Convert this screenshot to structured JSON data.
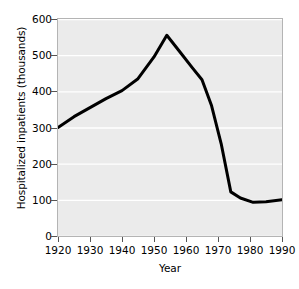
{
  "chart_data": {
    "type": "line",
    "title": "",
    "xlabel": "Year",
    "ylabel": "Hospitalized inpatients (thousands)",
    "xlim": [
      1920,
      1990
    ],
    "ylim": [
      0,
      600
    ],
    "xticks": [
      1920,
      1930,
      1940,
      1950,
      1960,
      1970,
      1980,
      1990
    ],
    "yticks": [
      0,
      100,
      200,
      300,
      400,
      500,
      600
    ],
    "grid": "horizontal",
    "legend": "none",
    "series": [
      {
        "name": "Hospitalized inpatients",
        "x": [
          1920,
          1925,
          1930,
          1935,
          1940,
          1945,
          1950,
          1954,
          1958,
          1962,
          1965,
          1968,
          1971,
          1974,
          1977,
          1981,
          1985,
          1990
        ],
        "values": [
          300,
          330,
          355,
          380,
          402,
          435,
          495,
          555,
          510,
          465,
          432,
          360,
          255,
          122,
          105,
          93,
          95,
          100
        ]
      }
    ],
    "line_color": "#000000",
    "line_width": 3,
    "plot_background": "#ebebeb",
    "gridline_color": "#ffffff"
  },
  "axis": {
    "y_tick_labels": [
      "600",
      "500",
      "400",
      "300",
      "200",
      "100",
      "0"
    ],
    "x_tick_labels": [
      "1920",
      "1930",
      "1940",
      "1950",
      "1960",
      "1970",
      "1980",
      "1990"
    ],
    "y_title": "Hospitalized inpatients (thousands)",
    "x_title": "Year"
  }
}
